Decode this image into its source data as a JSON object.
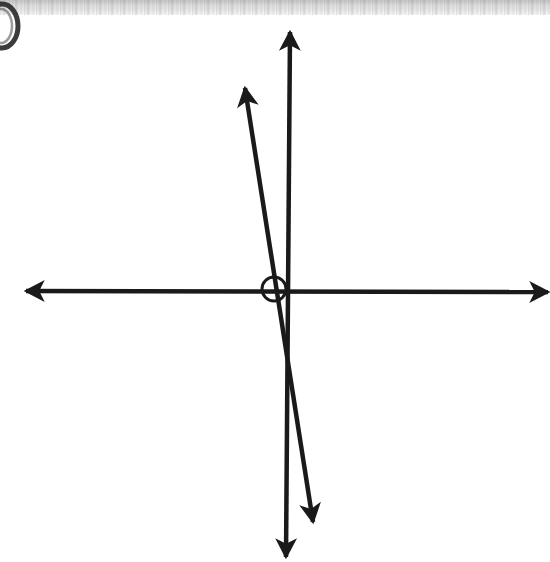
{
  "page": {
    "width": 550,
    "height": 562,
    "background_color": "#ffffff",
    "ink_color": "#1a1a1a",
    "scan_artifact": {
      "description": "gray scanned paper edge band across the top of the page",
      "color": "#e3e3e3",
      "height_px": 15
    },
    "corner_mark": {
      "description": "partial dark circular pen mark clipped at the top-left edge of the scan",
      "color": "#2b2b2b"
    }
  },
  "chart_data": {
    "type": "diagram",
    "title": "",
    "subtitle": "",
    "xlabel": "",
    "ylabel": "",
    "grid": false,
    "legend": false,
    "elements": [
      {
        "name": "horizontal-axis",
        "kind": "double-headed-arrow",
        "x1": 26,
        "y1": 291,
        "x2": 548,
        "y2": 292,
        "stroke_width": 4.5,
        "arrow_start": true,
        "arrow_end": true,
        "label": "horizontal line"
      },
      {
        "name": "vertical-axis",
        "kind": "double-headed-arrow",
        "x1": 290,
        "y1": 32,
        "x2": 286,
        "y2": 557,
        "stroke_width": 4.5,
        "arrow_start": true,
        "arrow_end": true,
        "label": "vertical line"
      },
      {
        "name": "transversal-line",
        "kind": "double-headed-arrow",
        "x1": 245,
        "y1": 88,
        "x2": 313,
        "y2": 522,
        "stroke_width": 4.5,
        "arrow_start": true,
        "arrow_end": true,
        "label": "slanted transversal line"
      },
      {
        "name": "angle-marker-circle",
        "kind": "circle",
        "cx": 274,
        "cy": 289,
        "r": 12,
        "stroke_width": 3,
        "fill": "none",
        "label": "angle marker at intersection"
      }
    ],
    "intersection_points": [
      {
        "name": "origin",
        "x": 288,
        "y": 291,
        "description": "horizontal and vertical lines meet"
      },
      {
        "name": "transversal-horizontal",
        "x": 277,
        "y": 290,
        "description": "transversal crosses the horizontal line"
      },
      {
        "name": "transversal-vertical",
        "x": 287,
        "y": 360,
        "description": "transversal crosses the vertical line below the origin"
      }
    ],
    "annotations": []
  }
}
